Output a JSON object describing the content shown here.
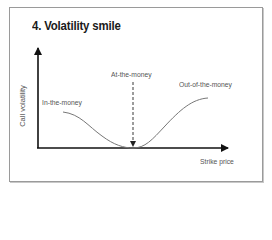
{
  "figure": {
    "title": "4. Volatility smile",
    "axes": {
      "y_label": "Call volatility",
      "x_label": "Strike price"
    },
    "annotations": {
      "left": "In-the-money",
      "center": "At-the-money",
      "right": "Out-of-the-money"
    },
    "colors": {
      "axis": "#111111",
      "curve": "#777777",
      "text": "#555555",
      "border": "#9a9a9a"
    }
  }
}
